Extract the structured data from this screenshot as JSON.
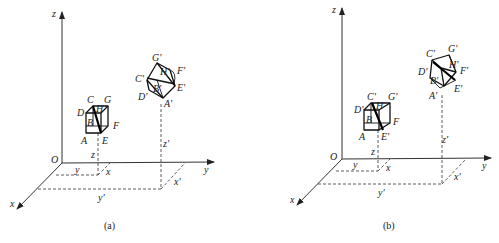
{
  "figure": {
    "panels": [
      {
        "id": "a",
        "caption": "(a)",
        "axes": {
          "origin": "O",
          "x": "x",
          "y": "y",
          "z": "z"
        },
        "original_cube": {
          "labels": [
            "A",
            "B",
            "C",
            "D",
            "E",
            "F",
            "G",
            "H"
          ]
        },
        "transformed_cube": {
          "labels": [
            "A'",
            "B'",
            "C'",
            "D'",
            "E'",
            "F'",
            "G'",
            "H'"
          ]
        },
        "coordinate_labels": {
          "z": "z",
          "y": "y",
          "x": "x",
          "z_prime": "z'",
          "y_prime": "y'",
          "x_prime": "x'"
        }
      },
      {
        "id": "b",
        "caption": "(b)",
        "axes": {
          "origin": "O",
          "x": "x",
          "y": "y",
          "z": "z"
        },
        "original_cube": {
          "labels": [
            "A",
            "B",
            "C'",
            "D'",
            "E'",
            "F",
            "G'",
            "H"
          ]
        },
        "transformed_cube": {
          "labels": [
            "A'",
            "B'",
            "C'",
            "D'",
            "E'",
            "F'",
            "G'",
            "H'"
          ]
        },
        "coordinate_labels": {
          "z": "z",
          "y": "y",
          "x": "x",
          "z_prime": "z'",
          "y_prime": "y'",
          "x_prime": "x'"
        }
      }
    ]
  }
}
